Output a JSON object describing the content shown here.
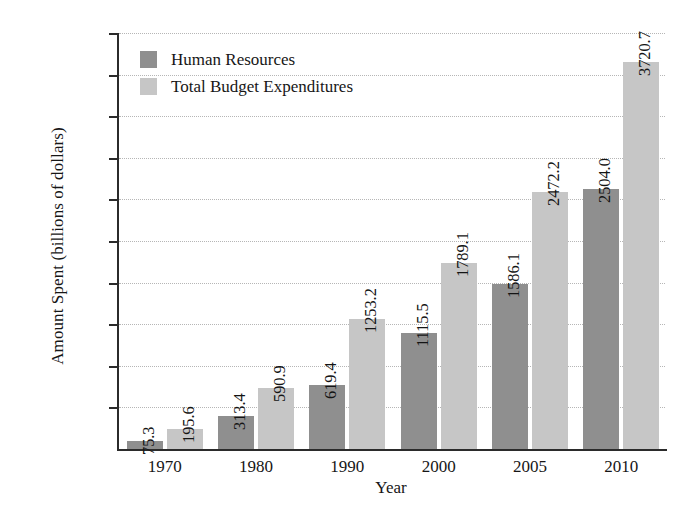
{
  "chart_data": {
    "type": "bar",
    "title": "",
    "subtitle": "",
    "xlabel": "Year",
    "ylabel": "Amount Spent (billions of dollars)",
    "categories": [
      "1970",
      "1980",
      "1990",
      "2000",
      "2005",
      "2010"
    ],
    "series": [
      {
        "name": "Human Resources",
        "color": "#8f8f8f",
        "values": [
          75.3,
          313.4,
          619.4,
          1115.5,
          1586.1,
          2504.0
        ],
        "labels": [
          "75.3",
          "313.4",
          "619.4",
          "1115.5",
          "1586.1",
          "2504.0"
        ]
      },
      {
        "name": "Total Budget Expenditures",
        "color": "#c6c6c6",
        "values": [
          195.6,
          590.9,
          1253.2,
          1789.1,
          2472.2,
          3720.7
        ],
        "labels": [
          "195.6",
          "590.9",
          "1253.2",
          "1789.1",
          "2472.2",
          "3720.7"
        ]
      }
    ],
    "ylim": [
      0,
      4000
    ],
    "ytick_values": [
      400,
      800,
      1200,
      1600,
      2000,
      2400,
      2800,
      3200,
      3600,
      4000
    ],
    "ytick_labels": [
      "$400",
      "$800",
      "$1200",
      "$1600",
      "$2000",
      "$2400",
      "$2800",
      "$3200",
      "$3600",
      "$4000"
    ],
    "grid": true,
    "grid_style": "dotted-horizontal",
    "legend_position": "top-left-inside",
    "bar_value_labels": true,
    "bar_value_label_rotation": 90
  },
  "legend": {
    "items": [
      {
        "label": "Human Resources",
        "color": "#8f8f8f"
      },
      {
        "label": "Total Budget Expenditures",
        "color": "#c6c6c6"
      }
    ]
  },
  "axes": {
    "y_title": "Amount Spent (billions of dollars)",
    "x_title": "Year"
  }
}
